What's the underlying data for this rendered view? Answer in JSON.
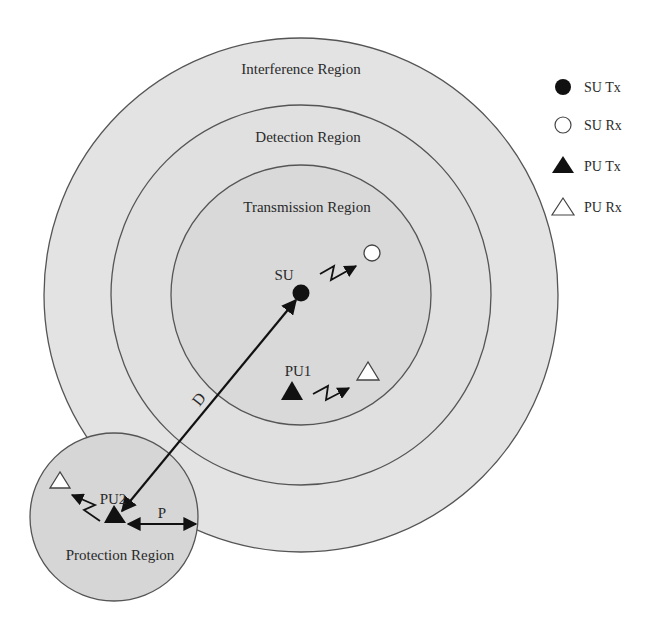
{
  "regions": {
    "interference": "Interference Region",
    "detection": "Detection Region",
    "transmission": "Transmission Region",
    "protection": "Protection Region"
  },
  "nodes": {
    "su": "SU",
    "pu1": "PU1",
    "pu2": "PU2"
  },
  "distances": {
    "d": "D",
    "p": "P"
  },
  "legend": [
    {
      "icon": "filled-circle",
      "label": "SU Tx"
    },
    {
      "icon": "hollow-circle",
      "label": "SU Rx"
    },
    {
      "icon": "filled-triangle",
      "label": "PU Tx"
    },
    {
      "icon": "hollow-triangle",
      "label": "PU Rx"
    }
  ],
  "colors": {
    "interference_fill": "#e3e3e3",
    "detection_fill": "#e0e0e0",
    "transmission_fill": "#d9d9d9",
    "protection_fill": "#d6d6d6",
    "stroke": "#555555",
    "marker": "#111111"
  }
}
